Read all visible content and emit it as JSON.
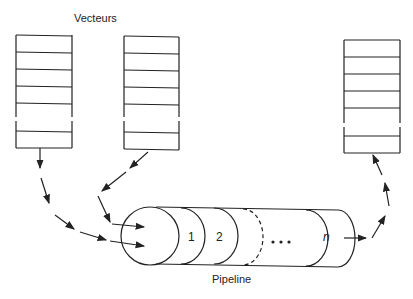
{
  "diagram": {
    "title_label": "Vecteurs",
    "pipeline_label": "Pipeline",
    "stages": [
      "1",
      "2",
      "",
      "...",
      "n"
    ],
    "vectors": [
      "input-vector-1",
      "input-vector-2",
      "output-vector"
    ],
    "line_color": "#222222"
  }
}
